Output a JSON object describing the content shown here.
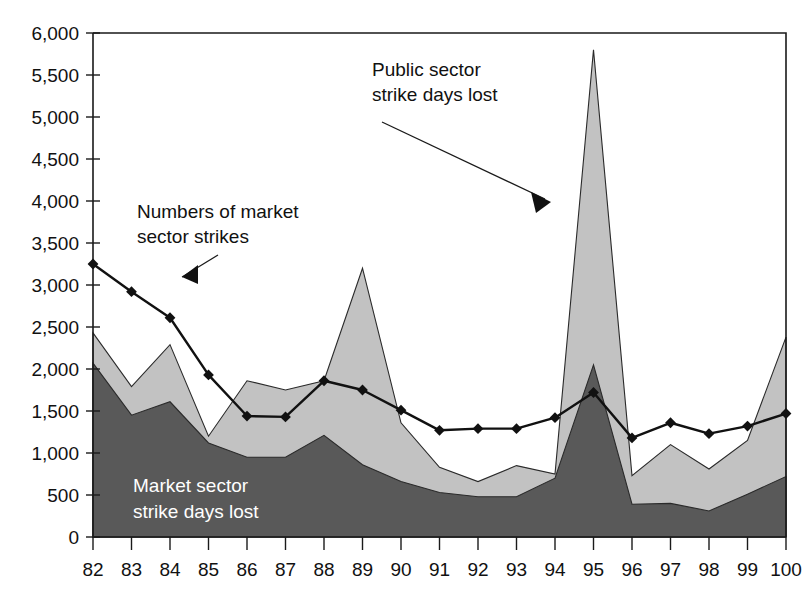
{
  "chart_data": {
    "type": "area",
    "title": "",
    "subtitle": "",
    "xlabel": "",
    "ylabel": "",
    "xlim": [
      82,
      100
    ],
    "ylim": [
      0,
      6000
    ],
    "grid": false,
    "legend_position": "inline-annotations",
    "x": [
      82,
      83,
      84,
      85,
      86,
      87,
      88,
      89,
      90,
      91,
      92,
      93,
      94,
      95,
      96,
      97,
      98,
      99,
      100
    ],
    "x_tick_labels": [
      "82",
      "83",
      "84",
      "85",
      "86",
      "87",
      "88",
      "89",
      "90",
      "91",
      "92",
      "93",
      "94",
      "95",
      "96",
      "97",
      "98",
      "99",
      "100"
    ],
    "y_tick_labels": [
      "0",
      "500",
      "1,000",
      "1,500",
      "2,000",
      "2,500",
      "3,000",
      "3,500",
      "4,000",
      "4,500",
      "5,000",
      "5,500",
      "6,000"
    ],
    "y_ticks": [
      0,
      500,
      1000,
      1500,
      2000,
      2500,
      3000,
      3500,
      4000,
      4500,
      5000,
      5500,
      6000
    ],
    "series": [
      {
        "name": "Market sector strike days lost",
        "kind": "area",
        "stacked": true,
        "color": "#595959",
        "values": [
          2070,
          1450,
          1610,
          1120,
          950,
          950,
          1210,
          860,
          660,
          530,
          480,
          480,
          700,
          2050,
          390,
          400,
          310,
          510,
          720
        ]
      },
      {
        "name": "Public sector strike days lost",
        "kind": "area",
        "stacked": true,
        "color": "#c2c2c2",
        "values": [
          360,
          340,
          680,
          80,
          910,
          800,
          650,
          2340,
          700,
          300,
          180,
          370,
          50,
          3750,
          340,
          700,
          500,
          640,
          1660
        ]
      },
      {
        "name": "Numbers of market sector strikes",
        "kind": "line",
        "color": "#111111",
        "marker": "diamond",
        "values": [
          3250,
          2920,
          2610,
          1930,
          1440,
          1430,
          1860,
          1750,
          1510,
          1270,
          1290,
          1290,
          1420,
          1720,
          1180,
          1360,
          1230,
          1320,
          1470
        ]
      }
    ],
    "stack_totals": [
      2430,
      1790,
      2290,
      1200,
      1860,
      1750,
      1860,
      3200,
      1360,
      830,
      660,
      850,
      750,
      5800,
      730,
      1100,
      810,
      1150,
      2380
    ],
    "annotations": [
      {
        "id": "market-strikes-annotation",
        "lines": [
          "Numbers of market",
          "sector strikes"
        ],
        "text_color": "#111111",
        "points_to": "line-series"
      },
      {
        "id": "public-sector-annotation",
        "lines": [
          "Public sector",
          "strike days lost"
        ],
        "text_color": "#111111",
        "points_to": "light-gray-area-peak-95"
      },
      {
        "id": "market-days-annotation",
        "lines": [
          "Market sector",
          "strike days lost"
        ],
        "text_color": "#ffffff",
        "points_to": "dark-gray-area"
      }
    ]
  },
  "colors": {
    "market_days_area": "#595959",
    "public_days_area": "#c2c2c2",
    "line_series": "#111111",
    "axis": "#1a1a1a",
    "background": "#ffffff"
  }
}
